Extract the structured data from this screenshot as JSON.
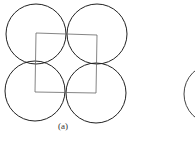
{
  "figure": {
    "label": "(a)",
    "circles": [
      {
        "cx": 36,
        "cy": 34,
        "r": 30
      },
      {
        "cx": 97,
        "cy": 34,
        "r": 30
      },
      {
        "cx": 35,
        "cy": 91,
        "r": 30
      },
      {
        "cx": 96,
        "cy": 93,
        "r": 30
      }
    ],
    "square": {
      "x": 35,
      "y": 33,
      "w": 62,
      "h": 60
    },
    "partial_circle": {
      "cx": 214,
      "cy": 94,
      "r": 30
    }
  }
}
